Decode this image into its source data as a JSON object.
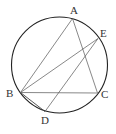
{
  "figure": {
    "circle": {
      "cx": 59.5,
      "cy": 65,
      "r": 48
    },
    "points": {
      "A": {
        "x": 72.5,
        "y": 18.5,
        "label": "A",
        "lx": 70,
        "ly": 14
      },
      "E": {
        "x": 98,
        "y": 38.5,
        "label": "E",
        "lx": 100,
        "ly": 37
      },
      "B": {
        "x": 20.5,
        "y": 92.5,
        "label": "B",
        "lx": 6,
        "ly": 97
      },
      "C": {
        "x": 97.5,
        "y": 93,
        "label": "C",
        "lx": 101,
        "ly": 98
      },
      "D": {
        "x": 45,
        "y": 111.5,
        "label": "D",
        "lx": 41,
        "ly": 124
      }
    },
    "segments": [
      "AB",
      "AC",
      "BC",
      "BE",
      "ED",
      "BD"
    ],
    "colors": {
      "circle": "#222222",
      "line": "#555555",
      "bc": "#888888"
    }
  }
}
